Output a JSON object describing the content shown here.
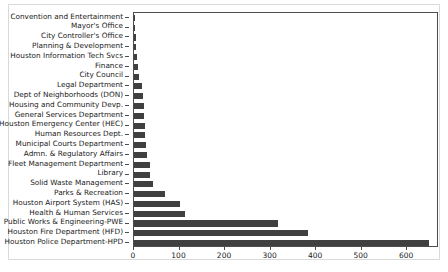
{
  "chart_data": {
    "type": "bar",
    "orientation": "horizontal",
    "title": "",
    "xlabel": "",
    "ylabel": "",
    "xlim": [
      0,
      670
    ],
    "ylim": [
      0,
      24
    ],
    "grid": false,
    "legend": null,
    "bar_color": "#404040",
    "axis_color": "#4d4d4d",
    "figure_border_color": "#d9d9d9",
    "background": "#ffffff",
    "xticks": [
      0,
      100,
      200,
      300,
      400,
      500,
      600
    ],
    "xtick_labels": [
      "0",
      "100",
      "200",
      "300",
      "400",
      "500",
      "600"
    ],
    "categories": [
      "Convention and Entertainment",
      "Mayor's Office",
      "City Controller's Office",
      "Planning & Development",
      "Houston Information Tech Svcs",
      "Finance",
      "City Council",
      "Legal Department",
      "Dept of Neighborhoods (DON)",
      "Housing and Community Devp.",
      "General Services Department",
      "Houston Emergency Center (HEC)",
      "Human Resources Dept.",
      "Municipal Courts Department",
      "Admn. & Regulatory Affairs",
      "Fleet Management Department",
      "Library",
      "Solid Waste Management",
      "Parks & Recreation",
      "Houston Airport System (HAS)",
      "Health & Human Services",
      "Public Works & Engineering-PWE",
      "Houston Fire Department (HFD)",
      "Houston Police Department-HPD"
    ],
    "values": [
      1,
      3,
      4,
      5,
      7,
      9,
      11,
      17,
      20,
      22,
      23,
      24,
      25,
      27,
      29,
      36,
      36,
      42,
      67,
      102,
      111,
      316,
      382,
      647
    ]
  }
}
